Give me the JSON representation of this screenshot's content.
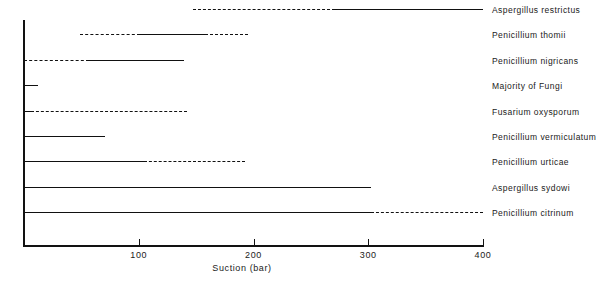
{
  "chart_data": {
    "type": "bar",
    "title": "",
    "subtitle": "",
    "xlabel": "Suction (bar)",
    "ylabel": "",
    "xlim": [
      0,
      400
    ],
    "grid": false,
    "legend": null,
    "orientation": "horizontal",
    "note": "Each row is a horizontal range bar. Solid segments denote the measured/confirmed suction range; dashed segments denote the extrapolated or uncertain extension of the range.",
    "xticks": [
      0,
      100,
      200,
      300,
      400
    ],
    "xticklabels": [
      "",
      "100",
      "200",
      "300",
      "400"
    ],
    "categories": [
      "Aspergillus restrictus",
      "Penicillium thomii",
      "Penicillium nigricans",
      "Majority of Fungi",
      "Fusarium oxysporum",
      "Penicillium vermiculatum",
      "Penicillium urticae",
      "Aspergillus sydowi",
      "Penicillium citrinum"
    ],
    "bars": [
      {
        "category": "Aspergillus restrictus",
        "start": 147,
        "end": 400,
        "segments": [
          {
            "from": 147,
            "to": 271,
            "style": "dashed"
          },
          {
            "from": 271,
            "to": 400,
            "style": "solid"
          }
        ]
      },
      {
        "category": "Penicillium thomii",
        "start": 49,
        "end": 195,
        "segments": [
          {
            "from": 49,
            "to": 101,
            "style": "dashed"
          },
          {
            "from": 101,
            "to": 158,
            "style": "solid"
          },
          {
            "from": 158,
            "to": 195,
            "style": "dashed"
          }
        ]
      },
      {
        "category": "Penicillium nigricans",
        "start": 0,
        "end": 139,
        "segments": [
          {
            "from": 0,
            "to": 57,
            "style": "dashed"
          },
          {
            "from": 57,
            "to": 139,
            "style": "solid"
          }
        ]
      },
      {
        "category": "Majority of Fungi",
        "start": 0,
        "end": 12,
        "segments": [
          {
            "from": 0,
            "to": 12,
            "style": "solid"
          }
        ]
      },
      {
        "category": "Fusarium oxysporum",
        "start": 0,
        "end": 142,
        "segments": [
          {
            "from": 0,
            "to": 6,
            "style": "solid"
          },
          {
            "from": 6,
            "to": 142,
            "style": "dashed"
          }
        ]
      },
      {
        "category": "Penicillium vermiculatum",
        "start": 0,
        "end": 71,
        "segments": [
          {
            "from": 0,
            "to": 71,
            "style": "solid"
          }
        ]
      },
      {
        "category": "Penicillium urticae",
        "start": 0,
        "end": 193,
        "segments": [
          {
            "from": 0,
            "to": 105,
            "style": "solid"
          },
          {
            "from": 105,
            "to": 193,
            "style": "dashed"
          }
        ]
      },
      {
        "category": "Aspergillus sydowi",
        "start": 0,
        "end": 302,
        "segments": [
          {
            "from": 0,
            "to": 302,
            "style": "solid"
          }
        ]
      },
      {
        "category": "Penicillium citrinum",
        "start": 0,
        "end": 400,
        "segments": [
          {
            "from": 0,
            "to": 302,
            "style": "solid"
          },
          {
            "from": 302,
            "to": 400,
            "style": "dashed"
          }
        ]
      }
    ]
  },
  "axis": {
    "x_title": "Suction (bar)",
    "tick_labels": [
      "100",
      "200",
      "300",
      "400"
    ]
  },
  "series_labels": [
    "Aspergillus restrictus",
    "Penicillium thomii",
    "Penicillium nigricans",
    "Majority of Fungi",
    "Fusarium oxysporum",
    "Penicillium vermiculatum",
    "Penicillium urticae",
    "Aspergillus sydowi",
    "Penicillium citrinum"
  ],
  "colors": {
    "ink": "#111111",
    "background": "#ffffff"
  }
}
